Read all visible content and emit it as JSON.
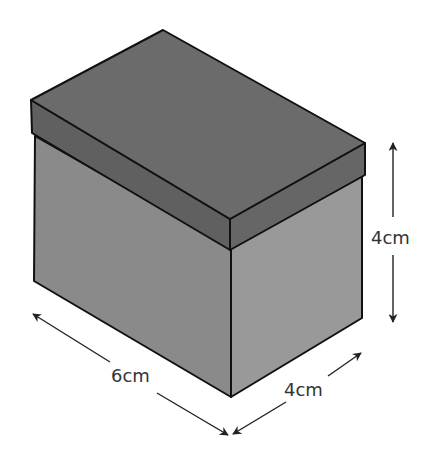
{
  "figure": {
    "type": "isometric box with lid",
    "dimensions": {
      "length": {
        "value": 6,
        "unit": "cm",
        "label": "6cm"
      },
      "width": {
        "value": 4,
        "unit": "cm",
        "label": "4cm"
      },
      "height": {
        "value": 4,
        "unit": "cm",
        "label": "4cm"
      }
    },
    "colors": {
      "lid_top": "#6b6b6b",
      "lid_band_front": "#606060",
      "lid_band_side": "#666666",
      "front_face": "#8a8a8a",
      "side_face": "#999999",
      "outline": "#111111",
      "arrow": "#222222",
      "label": "#333333"
    }
  }
}
